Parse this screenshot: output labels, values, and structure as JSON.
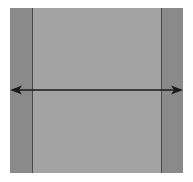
{
  "diagram": {
    "shapes": [
      {
        "id": "outer-square",
        "fill": "#a3a3a3"
      },
      {
        "id": "left-strip",
        "fill": "#8a8a8a"
      },
      {
        "id": "right-strip",
        "fill": "#8a8a8a"
      }
    ],
    "arrow": {
      "type": "double-headed",
      "orientation": "horizontal",
      "color": "#1a1a1a",
      "y": 90,
      "x1": 10,
      "x2": 182
    },
    "labels": []
  }
}
